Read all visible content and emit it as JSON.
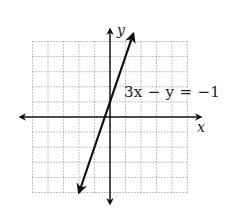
{
  "chart_data": {
    "type": "line",
    "title": "",
    "equation_label": "3x − y = −1",
    "xlabel": "x",
    "ylabel": "y",
    "xlim": [
      -5,
      5
    ],
    "ylim": [
      -5,
      5
    ],
    "grid": true,
    "grid_style": "dotted",
    "series": [
      {
        "name": "3x − y = −1",
        "slope": 3,
        "intercept": 1,
        "x": [
          -2,
          1.5
        ],
        "y": [
          -5,
          5.5
        ],
        "arrows": "both"
      }
    ]
  },
  "labels": {
    "x_axis": "x",
    "y_axis": "y",
    "equation": "3x − y = −1"
  },
  "colors": {
    "axis": "#111111",
    "line": "#111111",
    "grid": "#888888"
  }
}
